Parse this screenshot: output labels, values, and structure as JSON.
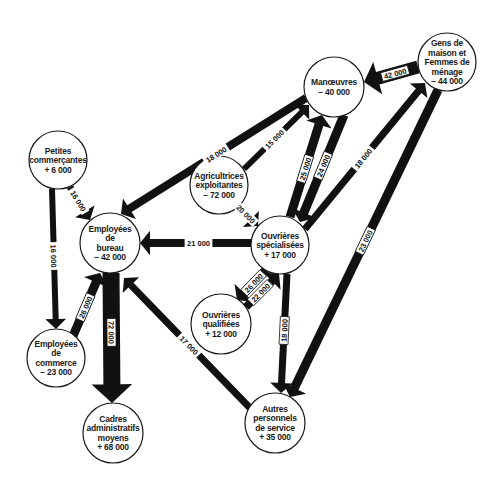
{
  "diagram": {
    "type": "flow-diagram",
    "nodes": [
      {
        "id": "manoeuvres",
        "lines": [
          "Manœuvres",
          "− 40 000"
        ],
        "cx": 334,
        "cy": 87,
        "r": 30
      },
      {
        "id": "gens_de_maison",
        "lines": [
          "Gens de",
          "maison et",
          "Femmes de",
          "ménage",
          "− 44 000"
        ],
        "cx": 447,
        "cy": 62,
        "r": 29
      },
      {
        "id": "petites_commercantes",
        "lines": [
          "Petites",
          "commerçantes",
          "+ 6 000"
        ],
        "cx": 58,
        "cy": 160,
        "r": 29
      },
      {
        "id": "agricultrices",
        "lines": [
          "Agricultrices",
          "exploitantes",
          "− 72 000"
        ],
        "cx": 219,
        "cy": 185,
        "r": 29
      },
      {
        "id": "employees_bureau",
        "lines": [
          "Employées",
          "de",
          "bureau",
          "− 42 000"
        ],
        "cx": 110,
        "cy": 243,
        "r": 30
      },
      {
        "id": "ouvrieres_specialisees",
        "lines": [
          "Ouvrières",
          "spécialisées",
          "+ 17 000"
        ],
        "cx": 280,
        "cy": 245,
        "r": 29
      },
      {
        "id": "ouvrieres_qualifiees",
        "lines": [
          "Ouvrières",
          "qualifiées",
          "+ 12 000"
        ],
        "cx": 221,
        "cy": 324,
        "r": 30
      },
      {
        "id": "employees_commerce",
        "lines": [
          "Employées",
          "de",
          "commerce",
          "− 23 000"
        ],
        "cx": 56,
        "cy": 358,
        "r": 29
      },
      {
        "id": "cadres",
        "lines": [
          "Cadres",
          "administratifs",
          "moyens",
          "+ 68 000"
        ],
        "cx": 113,
        "cy": 433,
        "r": 30
      },
      {
        "id": "autres_personnels",
        "lines": [
          "Autres",
          "personnels",
          "de service",
          "+ 35 000"
        ],
        "cx": 275,
        "cy": 423,
        "r": 30
      }
    ],
    "flows": [
      {
        "from": "gens_de_maison",
        "to": "manoeuvres",
        "label": "42 000",
        "value": 42000,
        "x1": 418,
        "y1": 67,
        "x2": 364,
        "y2": 82,
        "w": 13,
        "boxed": true
      },
      {
        "from": "manoeuvres",
        "to": "employees_bureau",
        "label": "18 000",
        "value": 18000,
        "x1": 306,
        "y1": 98,
        "x2": 121,
        "y2": 214,
        "w": 8,
        "boxed": false
      },
      {
        "from": "agricultrices",
        "to": "manoeuvres",
        "label": "15 000",
        "value": 15000,
        "x1": 244,
        "y1": 169,
        "x2": 309,
        "y2": 105,
        "w": 6,
        "boxed": false
      },
      {
        "from": "ouvrieres_specialisees",
        "to": "manoeuvres",
        "label": "25 000",
        "value": 25000,
        "x1": 290,
        "y1": 217,
        "x2": 322,
        "y2": 115,
        "w": 9,
        "boxed": true
      },
      {
        "from": "manoeuvres",
        "to": "ouvrieres_specialisees",
        "label": "24 000",
        "value": 24000,
        "x1": 344,
        "y1": 115,
        "x2": 300,
        "y2": 222,
        "w": 9,
        "boxed": true
      },
      {
        "from": "ouvrieres_specialisees",
        "to": "gens_de_maison",
        "label": "18 000",
        "value": 18000,
        "x1": 305,
        "y1": 229,
        "x2": 425,
        "y2": 83,
        "w": 7,
        "boxed": false
      },
      {
        "from": "gens_de_maison",
        "to": "autres_personnels",
        "label": "23 000",
        "value": 23000,
        "x1": 438,
        "y1": 90,
        "x2": 290,
        "y2": 397,
        "w": 9,
        "boxed": true
      },
      {
        "from": "petites_commercantes",
        "to": "employees_bureau",
        "label": "16 000",
        "value": 16000,
        "x1": 70,
        "y1": 187,
        "x2": 90,
        "y2": 220,
        "w": 7,
        "boxed": false
      },
      {
        "from": "petites_commercantes",
        "to": "employees_commerce",
        "label": "16 000",
        "value": 16000,
        "x1": 52,
        "y1": 189,
        "x2": 56,
        "y2": 329,
        "w": 6,
        "boxed": false
      },
      {
        "from": "agricultrices",
        "to": "ouvrieres_specialisees",
        "label": "20 000",
        "value": 20000,
        "x1": 238,
        "y1": 206,
        "x2": 258,
        "y2": 226,
        "w": 7,
        "boxed": false
      },
      {
        "from": "ouvrieres_specialisees",
        "to": "employees_bureau",
        "label": "21 000",
        "value": 21000,
        "x1": 251,
        "y1": 243,
        "x2": 140,
        "y2": 243,
        "w": 8,
        "boxed": false
      },
      {
        "from": "ouvrieres_specialisees",
        "to": "ouvrieres_qualifiees",
        "label": "26 000",
        "value": 26000,
        "x1": 266,
        "y1": 270,
        "x2": 237,
        "y2": 300,
        "w": 9,
        "boxed": true
      },
      {
        "from": "ouvrieres_qualifiees",
        "to": "ouvrieres_specialisees",
        "label": "22 000",
        "value": 22000,
        "x1": 246,
        "y1": 307,
        "x2": 279,
        "y2": 274,
        "w": 8,
        "boxed": true
      },
      {
        "from": "ouvrieres_specialisees",
        "to": "autres_personnels",
        "label": "18 000",
        "value": 18000,
        "x1": 287,
        "y1": 274,
        "x2": 281,
        "y2": 393,
        "w": 7,
        "boxed": true
      },
      {
        "from": "employees_commerce",
        "to": "employees_bureau",
        "label": "26 000",
        "value": 26000,
        "x1": 73,
        "y1": 336,
        "x2": 100,
        "y2": 273,
        "w": 9,
        "boxed": true
      },
      {
        "from": "employees_bureau",
        "to": "cadres",
        "label": "72 000",
        "value": 72000,
        "x1": 111,
        "y1": 273,
        "x2": 112,
        "y2": 403,
        "w": 17,
        "boxed": true
      },
      {
        "from": "autres_personnels",
        "to": "employees_bureau",
        "label": "17 000",
        "value": 17000,
        "x1": 250,
        "y1": 408,
        "x2": 124,
        "y2": 278,
        "w": 7,
        "boxed": false
      }
    ]
  }
}
